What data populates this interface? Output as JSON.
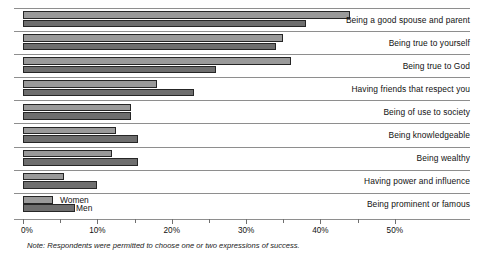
{
  "chart_data": {
    "type": "bar",
    "orientation": "horizontal",
    "title": "",
    "xlabel": "",
    "ylabel": "",
    "xlim": [
      0,
      55
    ],
    "xticks": [
      0,
      10,
      20,
      30,
      40,
      50
    ],
    "xticklabels": [
      "0%",
      "10%",
      "20%",
      "30%",
      "40%",
      "50%"
    ],
    "minor_ticks": [
      5,
      15,
      25,
      35,
      45
    ],
    "grid": false,
    "legend_position": "inline-last-row",
    "categories": [
      "Being a good spouse and parent",
      "Being true to yourself",
      "Being true to God",
      "Having friends that respect you",
      "Being of use to society",
      "Being knowledgeable",
      "Being wealthy",
      "Having power and influence",
      "Being prominent or famous"
    ],
    "series": [
      {
        "name": "Women",
        "color": "#9a9a9a",
        "values": [
          44,
          35,
          36,
          18,
          14.5,
          12.5,
          12,
          5.5,
          4
        ]
      },
      {
        "name": "Men",
        "color": "#6e6e6e",
        "values": [
          38,
          34,
          26,
          23,
          14.5,
          15.5,
          15.5,
          10,
          7
        ]
      }
    ],
    "note": "Note: Respondents were permitted to choose one or two expressions of success."
  },
  "legend": {
    "women_label": "Women",
    "men_label": "Men"
  }
}
